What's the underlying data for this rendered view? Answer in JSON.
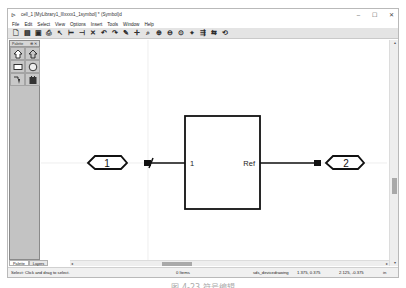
{
  "window": {
    "title": "cell_1 [MyLibrary1_lllxxxx1_1symbol] * (Symbol)d",
    "controls": {
      "minimize": "–",
      "maximize": "☐",
      "close": "✕"
    }
  },
  "menubar": {
    "items": [
      "File",
      "Edit",
      "Select",
      "View",
      "Options",
      "Insert",
      "Tools",
      "Window",
      "Help"
    ]
  },
  "toolbar": {
    "icons": [
      {
        "name": "new-icon",
        "glyph": "🗋"
      },
      {
        "name": "open-icon",
        "glyph": "▤"
      },
      {
        "name": "save-icon",
        "glyph": "▣"
      },
      {
        "name": "print-icon",
        "glyph": "⎙"
      },
      {
        "name": "select-icon",
        "glyph": "↖"
      },
      {
        "name": "fit-width-icon",
        "glyph": "⊢"
      },
      {
        "name": "fit-height-icon",
        "glyph": "⊣"
      },
      {
        "name": "delete-icon",
        "glyph": "✕"
      },
      {
        "name": "undo-icon",
        "glyph": "↶"
      },
      {
        "name": "redo-icon",
        "glyph": "↷"
      },
      {
        "name": "properties-icon",
        "glyph": "✎"
      },
      {
        "name": "move-icon",
        "glyph": "✛"
      },
      {
        "name": "zoom-area-icon",
        "glyph": "⌕"
      },
      {
        "name": "zoom-in-icon",
        "glyph": "⊕"
      },
      {
        "name": "zoom-out-icon",
        "glyph": "⊖"
      },
      {
        "name": "zoom-fit-icon",
        "glyph": "⊙"
      },
      {
        "name": "snap-icon",
        "glyph": "⌖"
      },
      {
        "name": "align-icon",
        "glyph": "⇶"
      },
      {
        "name": "flip-icon",
        "glyph": "⇆"
      },
      {
        "name": "rotate-icon",
        "glyph": "⟲"
      }
    ]
  },
  "palette": {
    "title": "Palette",
    "pin": "⊕",
    "close": "✕",
    "items": [
      {
        "name": "input-pin-tool-icon"
      },
      {
        "name": "output-pin-tool-icon"
      },
      {
        "name": "rectangle-tool-icon"
      },
      {
        "name": "circle-tool-icon"
      },
      {
        "name": "line-tool-icon"
      },
      {
        "name": "image-tool-icon"
      }
    ]
  },
  "bottom_tabs": [
    "Palette",
    "Layers"
  ],
  "canvas": {
    "symbol": {
      "left_port_number": "1",
      "right_port_number": "2",
      "left_pin_label": "1",
      "right_pin_label": "Ref"
    }
  },
  "statusbar": {
    "hint": "Select: Click and drag to select.",
    "items": "0 Items",
    "mode": "sds_devicedrawing",
    "coord1": "1.375, 0.375",
    "coord2": "2.125, -0.375",
    "units": "in"
  },
  "caption": "图 4-23  符号编辑"
}
